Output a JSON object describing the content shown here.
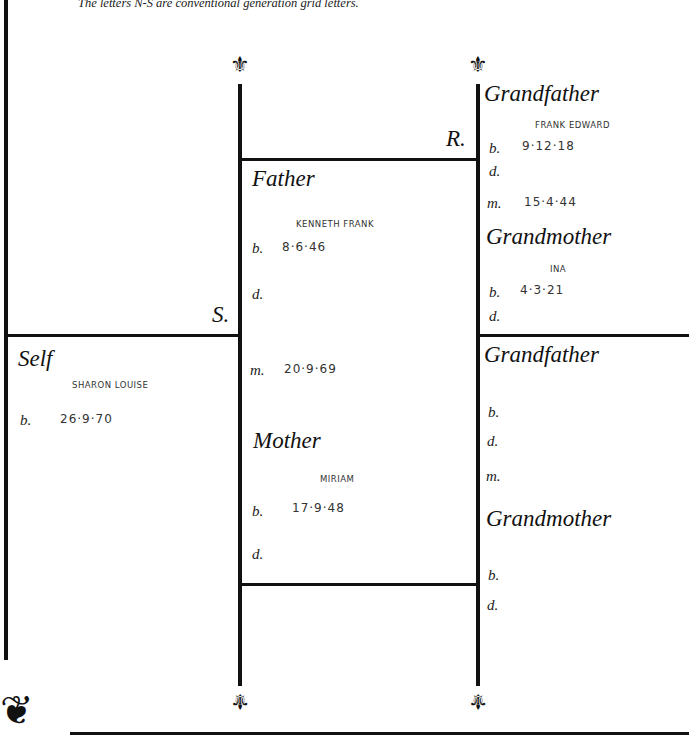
{
  "note": "The letters N-S are conventional generation grid letters.",
  "grid_letters": {
    "r": "R.",
    "s": "S."
  },
  "self": {
    "heading": "Self",
    "name": "SHARON LOUISE",
    "b_label": "b.",
    "b_value": "26·9·70"
  },
  "father": {
    "heading": "Father",
    "name": "KENNETH FRANK",
    "b_label": "b.",
    "b_value": "8·6·46",
    "d_label": "d.",
    "d_value": "",
    "m_label": "m.",
    "m_value": "20·9·69"
  },
  "mother": {
    "heading": "Mother",
    "name": "MIRIAM",
    "b_label": "b.",
    "b_value": "17·9·48",
    "d_label": "d.",
    "d_value": ""
  },
  "paternal_grandfather": {
    "heading": "Grandfather",
    "name": "FRANK EDWARD",
    "b_label": "b.",
    "b_value": "9·12·18",
    "d_label": "d.",
    "m_label": "m.",
    "m_value": "15·4·44"
  },
  "paternal_grandmother": {
    "heading": "Grandmother",
    "name": "INA",
    "b_label": "b.",
    "b_value": "4·3·21",
    "d_label": "d."
  },
  "maternal_grandfather": {
    "heading": "Grandfather",
    "b_label": "b.",
    "d_label": "d.",
    "m_label": "m."
  },
  "maternal_grandmother": {
    "heading": "Grandmother",
    "b_label": "b.",
    "d_label": "d."
  },
  "icons": {
    "fleur": "⚜",
    "corner": "❦"
  }
}
